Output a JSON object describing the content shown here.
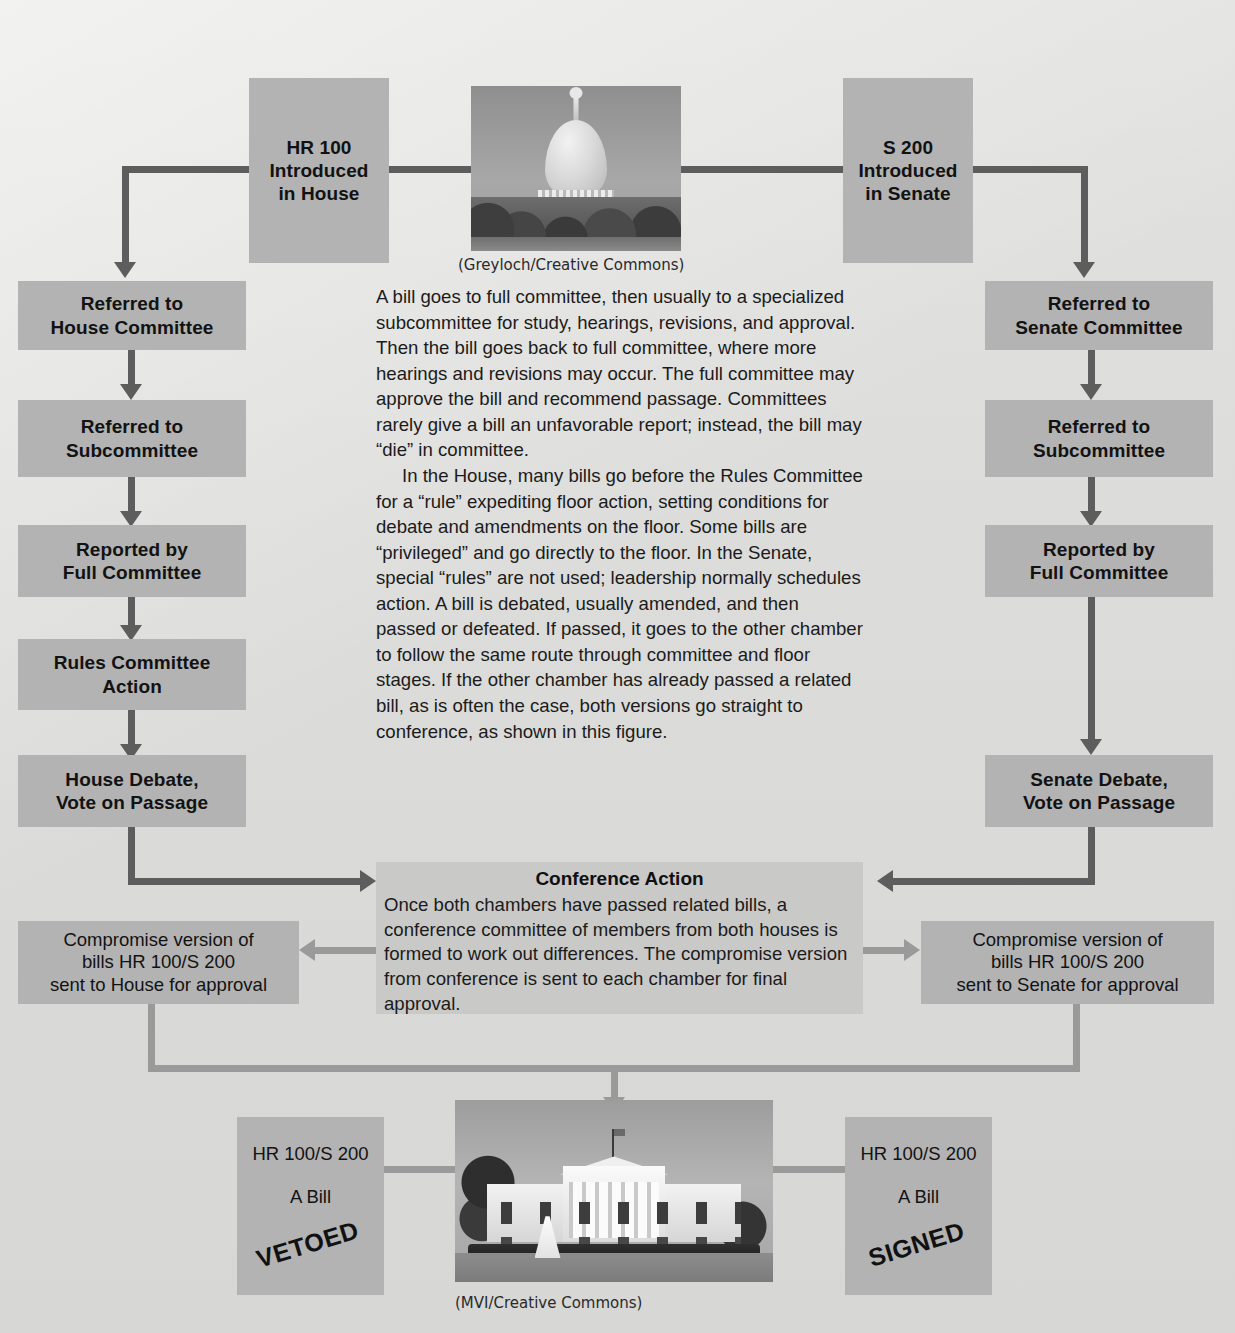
{
  "diagram": {
    "boxes": {
      "hr_intro": {
        "lines": [
          "HR 100",
          "Introduced",
          "in House"
        ]
      },
      "s_intro": {
        "lines": [
          "S 200",
          "Introduced",
          "in Senate"
        ]
      },
      "house_committee": {
        "lines": [
          "Referred to",
          "House Committee"
        ]
      },
      "house_subcommittee": {
        "lines": [
          "Referred to",
          "Subcommittee"
        ]
      },
      "house_full_committee": {
        "lines": [
          "Reported by",
          "Full Committee"
        ]
      },
      "rules_committee": {
        "lines": [
          "Rules Committee",
          "Action"
        ]
      },
      "house_debate": {
        "lines": [
          "House Debate,",
          "Vote on Passage"
        ]
      },
      "senate_committee": {
        "lines": [
          "Referred to",
          "Senate Committee"
        ]
      },
      "senate_subcommittee": {
        "lines": [
          "Referred to",
          "Subcommittee"
        ]
      },
      "senate_full_committee": {
        "lines": [
          "Reported by",
          "Full Committee"
        ]
      },
      "senate_debate": {
        "lines": [
          "Senate Debate,",
          "Vote on Passage"
        ]
      },
      "compromise_house": {
        "lines": [
          "Compromise version of",
          "bills HR 100/S 200",
          "sent to House for approval"
        ]
      },
      "compromise_senate": {
        "lines": [
          "Compromise version of",
          "bills HR 100/S 200",
          "sent to Senate for approval"
        ]
      },
      "vetoed_bill": {
        "lines": [
          "HR 100/S 200",
          "A Bill"
        ],
        "stamp": "VETOED"
      },
      "signed_bill": {
        "lines": [
          "HR 100/S 200",
          "A Bill"
        ],
        "stamp": "SIGNED"
      }
    },
    "narrative": {
      "paragraph_1": "A bill goes to full committee, then usually to a specialized subcommittee for study, hearings, revisions, and approval. Then the bill goes back to full committee, where more hearings and revisions may occur. The full committee may approve the bill and recommend passage. Committees rarely give a bill an unfavorable report; instead, the bill may “die” in committee.",
      "paragraph_2": "In the House, many bills go before the Rules Committee for a “rule” expediting floor action, setting conditions for debate and amendments on the floor. Some bills are “privileged” and go directly to the floor. In the Senate, special “rules” are not used; leadership normally schedules action. A bill is debated, usually amended, and then passed or defeated. If passed, it goes to the other chamber to follow the same route through committee and floor stages. If the other chamber has already passed a related bill, as is often the case, both versions go straight to conference, as shown in this figure."
    },
    "conference": {
      "title": "Conference Action",
      "body": "Once both chambers have passed related bills, a conference committee of members from both houses is formed to work out differences. The compromise version from conference is sent to each chamber for final approval."
    },
    "photos": {
      "capitol": {
        "caption": "(Greyloch/Creative Commons)",
        "subject": "United States Capitol"
      },
      "white_house": {
        "caption": "(MVI/Creative Commons)",
        "subject": "The White House"
      }
    },
    "colors": {
      "background": "#dededc",
      "box_fill": "#b3b3b3",
      "box_fill_light": "#c9c9c7",
      "arrow_dark": "#5d5d5d",
      "arrow_light": "#9a9a9a",
      "text": "#121212"
    }
  }
}
